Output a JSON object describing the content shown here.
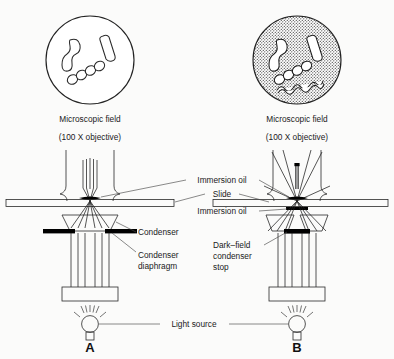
{
  "figure": {
    "background_color": "#fbfbfa",
    "ink_color": "#222222"
  },
  "panels": [
    {
      "id": "A",
      "panel_label": "A",
      "field_caption_line1": "Microscopic field",
      "field_caption_line2": "(100 X objective)",
      "field_type": "bright-field",
      "field_background": "white",
      "organisms": [
        "vibrio-comma",
        "rod-bacillus",
        "streptococcus-chain"
      ]
    },
    {
      "id": "B",
      "panel_label": "B",
      "field_caption_line1": "Microscopic field",
      "field_caption_line2": "(100 X objective)",
      "field_type": "dark-field",
      "field_background": "stippled-dark",
      "organisms": [
        "vibrio-comma",
        "rod-bacillus",
        "streptococcus-chain",
        "spirochete"
      ]
    }
  ],
  "labels": {
    "immersion_oil_top": "Immersion oil",
    "slide": "Slide",
    "immersion_oil_bottom": "Immersion oil",
    "condenser": "Condenser",
    "condenser_diaphragm_line1": "Condenser",
    "condenser_diaphragm_line2": "diaphragm",
    "darkfield_stop_line1": "Dark–field",
    "darkfield_stop_line2": "condenser",
    "darkfield_stop_line3": "stop",
    "light_source": "Light source"
  }
}
